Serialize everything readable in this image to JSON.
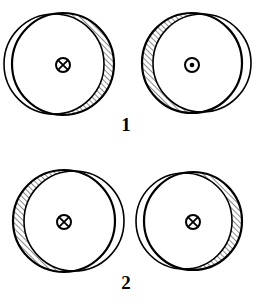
{
  "figure": {
    "background_color": "#ffffff",
    "stroke_color": "#000000",
    "hatch_color": "#000000",
    "width": 253,
    "height": 304,
    "rows": [
      {
        "label": "1",
        "label_x": 126,
        "label_y": 131,
        "items": [
          {
            "name": "circle-top-left",
            "outer": {
              "cx": 63,
              "cy": 64,
              "r": 51
            },
            "inner": {
              "cx": 54,
              "cy": 64,
              "r": 50
            },
            "hatch_side": "right",
            "symbol": "cross-in-circle",
            "symbol_meaning": "field-into-page",
            "symbol_x": 63,
            "symbol_y": 65,
            "symbol_r": 7
          },
          {
            "name": "circle-top-right",
            "outer": {
              "cx": 192,
              "cy": 63,
              "r": 50
            },
            "inner": {
              "cx": 202,
              "cy": 63,
              "r": 49
            },
            "hatch_side": "left",
            "symbol": "dot-in-circle",
            "symbol_meaning": "field-out-of-page",
            "symbol_x": 192,
            "symbol_y": 65,
            "symbol_r": 7
          }
        ]
      },
      {
        "label": "2",
        "label_x": 126,
        "label_y": 289,
        "items": [
          {
            "name": "circle-bottom-left",
            "outer": {
              "cx": 64,
              "cy": 221,
              "r": 51
            },
            "inner": {
              "cx": 74,
              "cy": 221,
              "r": 50
            },
            "hatch_side": "left",
            "symbol": "cross-in-circle",
            "symbol_meaning": "field-into-page",
            "symbol_x": 64,
            "symbol_y": 222,
            "symbol_r": 7
          },
          {
            "name": "circle-bottom-right",
            "outer": {
              "cx": 193,
              "cy": 221,
              "r": 49
            },
            "inner": {
              "cx": 184,
              "cy": 221,
              "r": 48
            },
            "hatch_side": "right",
            "symbol": "cross-in-circle",
            "symbol_meaning": "field-into-page",
            "symbol_x": 193,
            "symbol_y": 222,
            "symbol_r": 7
          }
        ]
      }
    ],
    "hatch": {
      "angle_deg": 45,
      "spacing_px": 4,
      "line_width": 0.9
    },
    "outline_width": 2.2,
    "inner_outline_width": 1.6
  }
}
